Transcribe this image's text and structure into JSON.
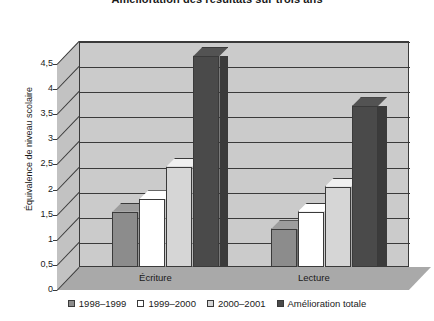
{
  "chart_data": {
    "type": "bar",
    "title": "Amélioration des résultats sur trois ans",
    "xlabel": "",
    "ylabel": "Équivalence de niveau scolaire",
    "categories": [
      "Écriture",
      "Lecture"
    ],
    "series": [
      {
        "name": "1998–1999",
        "values": [
          1.1,
          0.75
        ],
        "color": "#8c8c8c"
      },
      {
        "name": "1999–2000",
        "values": [
          1.35,
          1.1
        ],
        "color": "#ffffff"
      },
      {
        "name": "2000–2001",
        "values": [
          2.0,
          1.6
        ],
        "color": "#d6d6d6"
      },
      {
        "name": "Amélioration totale",
        "values": [
          4.2,
          3.2
        ],
        "color": "#4a4a4a"
      }
    ],
    "ylim": [
      0,
      4.5
    ],
    "ytick_labels": [
      "0",
      "0,5",
      "1",
      "1,5",
      "2",
      "2,5",
      "3",
      "3,5",
      "4",
      "4,5"
    ],
    "ytick_values": [
      0,
      0.5,
      1,
      1.5,
      2,
      2.5,
      3,
      3.5,
      4,
      4.5
    ],
    "grid": true,
    "legend_position": "bottom",
    "style_3d": true
  },
  "legend": {
    "items": [
      {
        "label": "1998–1999",
        "color": "#8c8c8c"
      },
      {
        "label": "1999–2000",
        "color": "#ffffff"
      },
      {
        "label": "2000–2001",
        "color": "#d6d6d6"
      },
      {
        "label": "Amélioration totale",
        "color": "#4a4a4a"
      }
    ]
  }
}
